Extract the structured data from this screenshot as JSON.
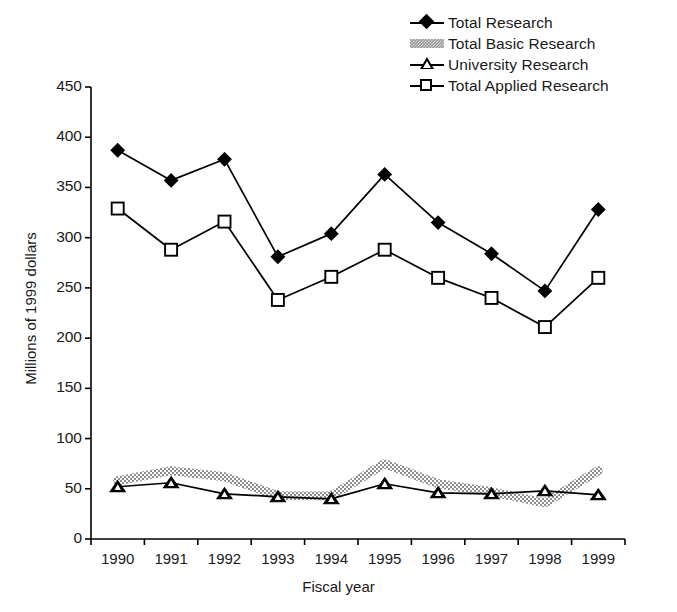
{
  "chart_data": {
    "type": "line",
    "title": "",
    "xlabel": "Fiscal year",
    "ylabel": "Millions of 1999 dollars",
    "categories": [
      "1990",
      "1991",
      "1992",
      "1993",
      "1994",
      "1995",
      "1996",
      "1997",
      "1998",
      "1999"
    ],
    "x": [
      1990,
      1991,
      1992,
      1993,
      1994,
      1995,
      1996,
      1997,
      1998,
      1999
    ],
    "ylim": [
      0,
      450
    ],
    "xlim": [
      1989.5,
      1999.5
    ],
    "yticks": [
      0,
      50,
      100,
      150,
      200,
      250,
      300,
      350,
      400,
      450
    ],
    "ytick_labels": [
      "0",
      "50",
      "100",
      "150",
      "200",
      "250",
      "300",
      "350",
      "400",
      "450"
    ],
    "grid": false,
    "legend_position": "top-right",
    "series": [
      {
        "name": "Total Research",
        "marker": "filled-diamond",
        "color": "#000000",
        "values": [
          387,
          357,
          378,
          281,
          304,
          363,
          315,
          284,
          247,
          328
        ]
      },
      {
        "name": "Total Basic Research",
        "marker": "gray-band",
        "color": "#9a9a9a",
        "values": [
          58,
          68,
          62,
          43,
          43,
          75,
          55,
          47,
          36,
          68
        ]
      },
      {
        "name": "University Research",
        "marker": "filled-triangle",
        "color": "#000000",
        "values": [
          52,
          56,
          45,
          42,
          40,
          55,
          46,
          45,
          48,
          44
        ]
      },
      {
        "name": "Total Applied Research",
        "marker": "open-square",
        "color": "#000000",
        "values": [
          329,
          288,
          316,
          238,
          261,
          288,
          260,
          240,
          211,
          260
        ]
      }
    ]
  },
  "legend": {
    "items": [
      {
        "label": "Total Research",
        "marker": "filled-diamond"
      },
      {
        "label": "Total Basic Research",
        "marker": "gray-band"
      },
      {
        "label": "University Research",
        "marker": "filled-triangle"
      },
      {
        "label": "Total Applied Research",
        "marker": "open-square"
      }
    ]
  },
  "axes": {
    "y_title": "Millions of 1999 dollars",
    "x_title": "Fiscal year"
  }
}
